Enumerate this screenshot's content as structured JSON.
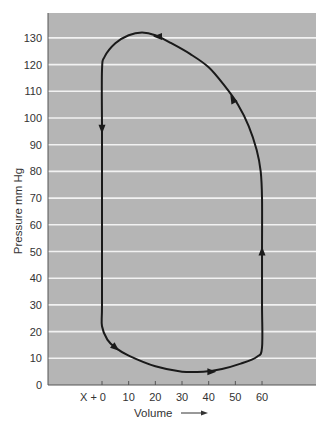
{
  "chart_data": {
    "type": "line",
    "title": "",
    "xlabel": "Volume",
    "xlabel_arrow": "right-arrow-icon",
    "ylabel": "Pressure mm Hg",
    "xlim": [
      -20,
      80
    ],
    "ylim": [
      0,
      137
    ],
    "grid": "horizontal",
    "colors": {
      "plot_bg": "#b5b5b5",
      "grid": "#f2f2f2",
      "curve": "#1a1a1a",
      "text": "#333333"
    },
    "y_ticks": [
      0,
      10,
      20,
      30,
      40,
      50,
      60,
      70,
      80,
      90,
      100,
      110,
      120,
      130
    ],
    "y_tick_labels": [
      "0",
      "10",
      "20",
      "30",
      "40",
      "50",
      "60",
      "70",
      "80",
      "90",
      "100",
      "110",
      "120",
      "130"
    ],
    "x_ticks": [
      0,
      10,
      20,
      30,
      40,
      50,
      60
    ],
    "x_tick_labels": [
      "X + 0",
      "10",
      "20",
      "30",
      "40",
      "50",
      "60"
    ],
    "series": [
      {
        "name": "pressure-volume loop",
        "closed": true,
        "points": [
          {
            "x": 0,
            "y": 97
          },
          {
            "x": 0,
            "y": 60
          },
          {
            "x": 0,
            "y": 30
          },
          {
            "x": 0,
            "y": 22
          },
          {
            "x": 2,
            "y": 17
          },
          {
            "x": 5,
            "y": 14
          },
          {
            "x": 10,
            "y": 11
          },
          {
            "x": 20,
            "y": 7
          },
          {
            "x": 30,
            "y": 5
          },
          {
            "x": 38,
            "y": 5
          },
          {
            "x": 45,
            "y": 6
          },
          {
            "x": 52,
            "y": 8
          },
          {
            "x": 58,
            "y": 10.5
          },
          {
            "x": 60,
            "y": 14
          },
          {
            "x": 60,
            "y": 30
          },
          {
            "x": 60,
            "y": 50
          },
          {
            "x": 60,
            "y": 70
          },
          {
            "x": 59.5,
            "y": 80
          },
          {
            "x": 58,
            "y": 88
          },
          {
            "x": 55,
            "y": 97
          },
          {
            "x": 51,
            "y": 105
          },
          {
            "x": 46,
            "y": 112
          },
          {
            "x": 40,
            "y": 119
          },
          {
            "x": 33,
            "y": 124
          },
          {
            "x": 26,
            "y": 128
          },
          {
            "x": 20,
            "y": 131
          },
          {
            "x": 15,
            "y": 132
          },
          {
            "x": 10,
            "y": 131
          },
          {
            "x": 5,
            "y": 128
          },
          {
            "x": 1,
            "y": 123
          },
          {
            "x": 0,
            "y": 118
          },
          {
            "x": 0,
            "y": 97
          }
        ],
        "arrows": [
          {
            "x": 0,
            "y": 96,
            "direction": "down"
          },
          {
            "x": 5,
            "y": 14,
            "direction": "down-right"
          },
          {
            "x": 41,
            "y": 5,
            "direction": "right"
          },
          {
            "x": 60,
            "y": 50,
            "direction": "up"
          },
          {
            "x": 49,
            "y": 107,
            "direction": "up-left"
          },
          {
            "x": 21,
            "y": 130.5,
            "direction": "left"
          }
        ]
      }
    ]
  }
}
